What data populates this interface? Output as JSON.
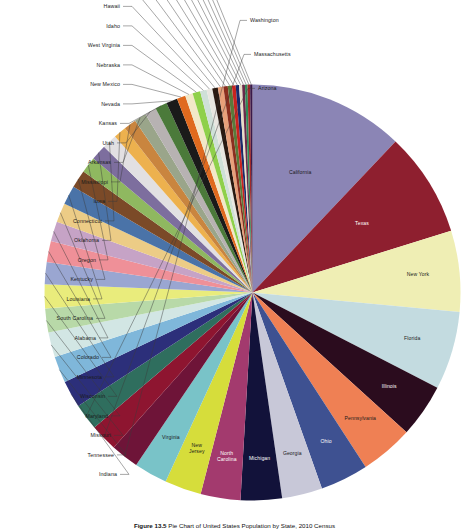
{
  "figure": {
    "caption_label": "Figure 13.5",
    "caption_text": "Pie Chart of United States Population by State, 2010 Census"
  },
  "chart_data": {
    "type": "pie",
    "title": "",
    "xlabel": "",
    "ylabel": "",
    "legend_position": "none",
    "label_mode": "inside-largest-and-leader-lines",
    "units": "population",
    "categories": [
      "California",
      "Texas",
      "New York",
      "Florida",
      "Illinois",
      "Pennsylvania",
      "Ohio",
      "Georgia",
      "Michigan",
      "North Carolina",
      "New Jersey",
      "Virginia",
      "Washington",
      "Massachusetts",
      "Arizona",
      "Indiana",
      "Tennessee",
      "Missouri",
      "Maryland",
      "Wisconsin",
      "Minnesota",
      "Colorado",
      "Alabama",
      "South Carolina",
      "Louisiana",
      "Kentucky",
      "Oregon",
      "Oklahoma",
      "Connecticut",
      "Iowa",
      "Mississippi",
      "Arkansas",
      "Utah",
      "Kansas",
      "Nevada",
      "New Mexico",
      "Nebraska",
      "West Virginia",
      "Idaho",
      "Hawaii",
      "Maine",
      "New Hampshire",
      "Rhode Island",
      "Montana",
      "Delaware",
      "South Dakota",
      "Alaska",
      "North Dakota",
      "District of Columbia",
      "Vermont",
      "Wyoming"
    ],
    "values": [
      37253956,
      25145561,
      19378102,
      18801310,
      12830632,
      12702379,
      11536504,
      9687653,
      9883640,
      9535483,
      8791894,
      8001024,
      6724540,
      6547629,
      6392017,
      6483802,
      6346105,
      5988927,
      5773552,
      5686986,
      5303925,
      5029196,
      4779736,
      4625364,
      4533372,
      4339367,
      3831074,
      3751351,
      3574097,
      3046355,
      2967297,
      2915918,
      2763885,
      2853118,
      2700551,
      2059179,
      1826341,
      1852994,
      1567582,
      1360301,
      1328361,
      1316470,
      1052567,
      989415,
      897934,
      814180,
      710231,
      672591,
      601723,
      625741,
      563626
    ],
    "colors": [
      "#8b85b5",
      "#8e1f2f",
      "#efeeb4",
      "#c3dbe0",
      "#2b0c1e",
      "#ef8054",
      "#3e5191",
      "#c8c8d8",
      "#12123a",
      "#a33a6e",
      "#d6dd3b",
      "#79c3c8",
      "#6e1438",
      "#8e1530",
      "#2f6e5e",
      "#2c2f7a",
      "#7fb7da",
      "#d2e6e4",
      "#b8d9a8",
      "#e9ec7c",
      "#9aa6d1",
      "#ef9098",
      "#c6a3c6",
      "#eccc86",
      "#4a73a8",
      "#7b4a28",
      "#8fb860",
      "#7d6e9e",
      "#e2e0e2",
      "#edb14e",
      "#c9853f",
      "#9aa58a",
      "#b7b2b2",
      "#4b7a3a",
      "#1a1a1a",
      "#e06a1e",
      "#f2e8c8",
      "#8fd04a",
      "#cfe0d8",
      "#e8e6e0",
      "#2a1a12",
      "#e8a07a",
      "#8b2f1f",
      "#5a7a3a",
      "#c8241f",
      "#1a2a6a",
      "#e8dfc8",
      "#6a2a4a",
      "#2e8b57",
      "#a02a2a",
      "#3a1a4a"
    ],
    "inner_labeled": [
      "California",
      "Texas",
      "New York",
      "Florida",
      "Illinois",
      "Pennsylvania",
      "Ohio",
      "Georgia",
      "Michigan",
      "North Carolina",
      "New Jersey",
      "Virginia"
    ],
    "leader_labeled": [
      "Washington",
      "Massachusetts",
      "Arizona",
      "Indiana",
      "Tennessee",
      "Missouri",
      "Maryland",
      "Wisconsin",
      "Minnesota",
      "Colorado",
      "Alabama",
      "South Carolina",
      "Louisiana",
      "Kentucky",
      "Oregon",
      "Oklahoma",
      "Connecticut",
      "Iowa",
      "Mississippi",
      "Arkansas",
      "Utah",
      "Kansas",
      "Nevada",
      "New Mexico",
      "Nebraska",
      "West Virginia",
      "Idaho",
      "Hawaii",
      "Maine",
      "New Hampshire",
      "Rhode Island",
      "Montana",
      "Delaware",
      "South Dakota",
      "Alaska",
      "North Dakota",
      "District of Columbia",
      "Vermont",
      "Wyoming"
    ],
    "label_overrides": {
      "New Jersey": [
        "New",
        "Jersey"
      ],
      "North Carolina": [
        "North",
        "Carolina"
      ]
    }
  }
}
